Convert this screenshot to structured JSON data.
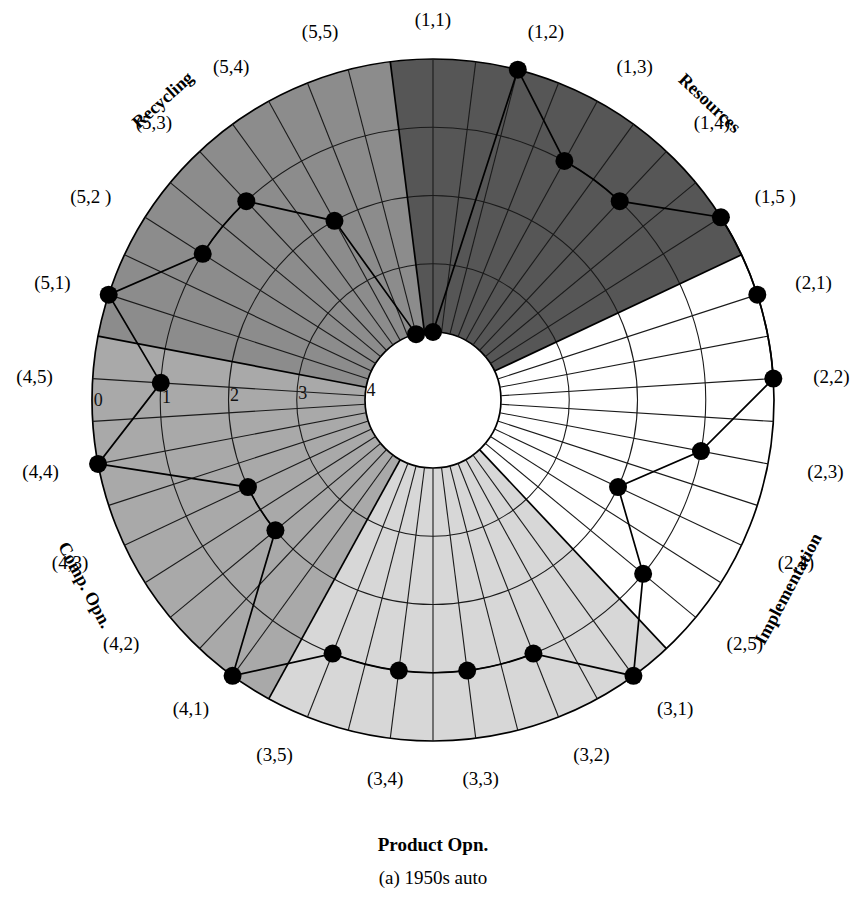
{
  "caption": {
    "main_label": "Product Opn.",
    "sub_label": "(a) 1950s auto"
  },
  "sectors": [
    {
      "name": "Resources",
      "label": "Resources",
      "color": "#565656",
      "key": "1"
    },
    {
      "name": "Implementation",
      "label": "Implementation",
      "color": "#ffffff",
      "key": "2"
    },
    {
      "name": "Product Opn.",
      "label": "Product Opn.",
      "color": "#d7d7d7",
      "key": "3"
    },
    {
      "name": "Comp. Opn.",
      "label": "Comp. Opn.",
      "color": "#a9a9a9",
      "key": "4"
    },
    {
      "name": "Recycling",
      "label": "Recycling",
      "color": "#8c8c8c",
      "key": "5"
    }
  ],
  "ring_labels": [
    "0",
    "1",
    "2",
    "3",
    "4"
  ],
  "axis_labels": [
    "(1,1)",
    "(1,2)",
    "(1,3)",
    "(1,4)",
    "(1,5 )",
    "(2,1)",
    "(2,2)",
    "(2,3)",
    "(2,4)",
    "(2,5)",
    "(3,1)",
    "(3,2)",
    "(3,3)",
    "(3,4)",
    "(3,5)",
    "(4,1)",
    "(4,2)",
    "(4,3)",
    "(4,4)",
    "(4,5)",
    "(5,1)",
    "(5,2 )",
    "(5,3)",
    "(5,4)",
    "(5,5)"
  ],
  "chart_data": {
    "type": "radar",
    "title": "Product Opn.",
    "subtitle": "(a) 1950s auto",
    "radial_scale": {
      "min": 0,
      "max": 4,
      "ticks": [
        0,
        1,
        2,
        3,
        4
      ],
      "direction": "inward",
      "note": "0 at outer rim, 4 at inner circle"
    },
    "n_axes": 25,
    "grid": true,
    "legend": "none",
    "categories": [
      "(1,1)",
      "(1,2)",
      "(1,3)",
      "(1,4)",
      "(1,5 )",
      "(2,1)",
      "(2,2)",
      "(2,3)",
      "(2,4)",
      "(2,5)",
      "(3,1)",
      "(3,2)",
      "(3,3)",
      "(3,4)",
      "(3,5)",
      "(4,1)",
      "(4,2)",
      "(4,3)",
      "(4,4)",
      "(4,5)",
      "(5,1)",
      "(5,2 )",
      "(5,3)",
      "(5,4)",
      "(5,5)"
    ],
    "values": [
      4,
      0,
      1,
      1,
      0,
      0,
      0,
      1,
      2,
      1,
      0,
      1,
      1,
      1,
      1,
      0,
      2,
      2,
      0,
      1,
      0,
      1,
      1,
      2,
      4
    ],
    "series": [
      {
        "name": "1950s auto",
        "groups": [
          {
            "sector": "Resources",
            "axes": [
              "(1,1)",
              "(1,2)",
              "(1,3)",
              "(1,4)",
              "(1,5 )"
            ],
            "values": [
              4,
              0,
              1,
              1,
              0
            ]
          },
          {
            "sector": "Implementation",
            "axes": [
              "(2,1)",
              "(2,2)",
              "(2,3)",
              "(2,4)",
              "(2,5)"
            ],
            "values": [
              0,
              0,
              1,
              2,
              1
            ]
          },
          {
            "sector": "Product Opn.",
            "axes": [
              "(3,1)",
              "(3,2)",
              "(3,3)",
              "(3,4)",
              "(3,5)"
            ],
            "values": [
              0,
              1,
              1,
              1,
              1
            ]
          },
          {
            "sector": "Comp. Opn.",
            "axes": [
              "(4,1)",
              "(4,2)",
              "(4,3)",
              "(4,4)",
              "(4,5)"
            ],
            "values": [
              0,
              2,
              2,
              0,
              1
            ]
          },
          {
            "sector": "Recycling",
            "axes": [
              "(5,1)",
              "(5,2 )",
              "(5,3)",
              "(5,4)",
              "(5,5)"
            ],
            "values": [
              0,
              1,
              1,
              2,
              4
            ]
          }
        ]
      }
    ]
  },
  "geometry": {
    "center_x": 433,
    "center_y": 400,
    "outer_radius": 341,
    "inner_radius": 68
  }
}
